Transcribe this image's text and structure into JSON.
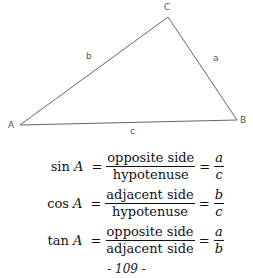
{
  "figure": {
    "vertices": {
      "A": "A",
      "B": "B",
      "C": "C"
    },
    "sides": {
      "a": "a",
      "b": "b",
      "c": "c"
    }
  },
  "formulas": [
    {
      "func": "sin",
      "angle": "A",
      "numerator": "opposite side",
      "denominator": "hypotenuse",
      "var_num": "a",
      "var_den": "c"
    },
    {
      "func": "cos",
      "angle": "A",
      "numerator": "adjacent side",
      "denominator": "hypotenuse",
      "var_num": "b",
      "var_den": "c"
    },
    {
      "func": "tan",
      "angle": "A",
      "numerator": "opposite side",
      "denominator": "adjacent side",
      "var_num": "a",
      "var_den": "b"
    }
  ],
  "symbols": {
    "equals": "="
  },
  "page_number": "- 109 -"
}
